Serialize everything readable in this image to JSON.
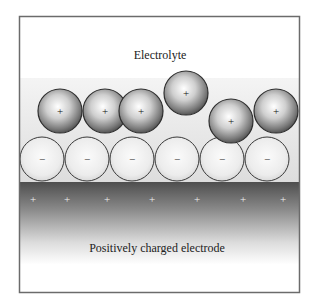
{
  "diagram": {
    "frame": {
      "x": 19,
      "y": 16,
      "width": 281,
      "height": 277
    },
    "electrolyte_label": "Electrolyte",
    "electrode_label": "Positively charged electrode",
    "electrolyte_band_top": 78,
    "electrode_top": 182,
    "cation_sign": "+",
    "anion_sign": "−",
    "electrode_sign": "+",
    "ion_radius": 22,
    "cations": [
      {
        "cx": 60,
        "cy": 111
      },
      {
        "cx": 105,
        "cy": 111
      },
      {
        "cx": 141,
        "cy": 111
      },
      {
        "cx": 186,
        "cy": 93
      },
      {
        "cx": 231,
        "cy": 121
      },
      {
        "cx": 276,
        "cy": 111
      }
    ],
    "anions": [
      {
        "cx": 42,
        "cy": 159
      },
      {
        "cx": 87,
        "cy": 159
      },
      {
        "cx": 132,
        "cy": 159
      },
      {
        "cx": 177,
        "cy": 159
      },
      {
        "cx": 222,
        "cy": 159
      },
      {
        "cx": 267,
        "cy": 159
      }
    ],
    "electrode_charges_x": [
      33,
      67,
      107,
      152,
      197,
      243,
      283
    ],
    "electrode_charges_y": 199,
    "colors": {
      "frame": "#6b6b6b",
      "electrode_dark": "#555555",
      "cation_edge": "#3a3a3a",
      "anion_fill": "#e8e8e8",
      "electrolyte_band": "#eeeeee"
    }
  }
}
